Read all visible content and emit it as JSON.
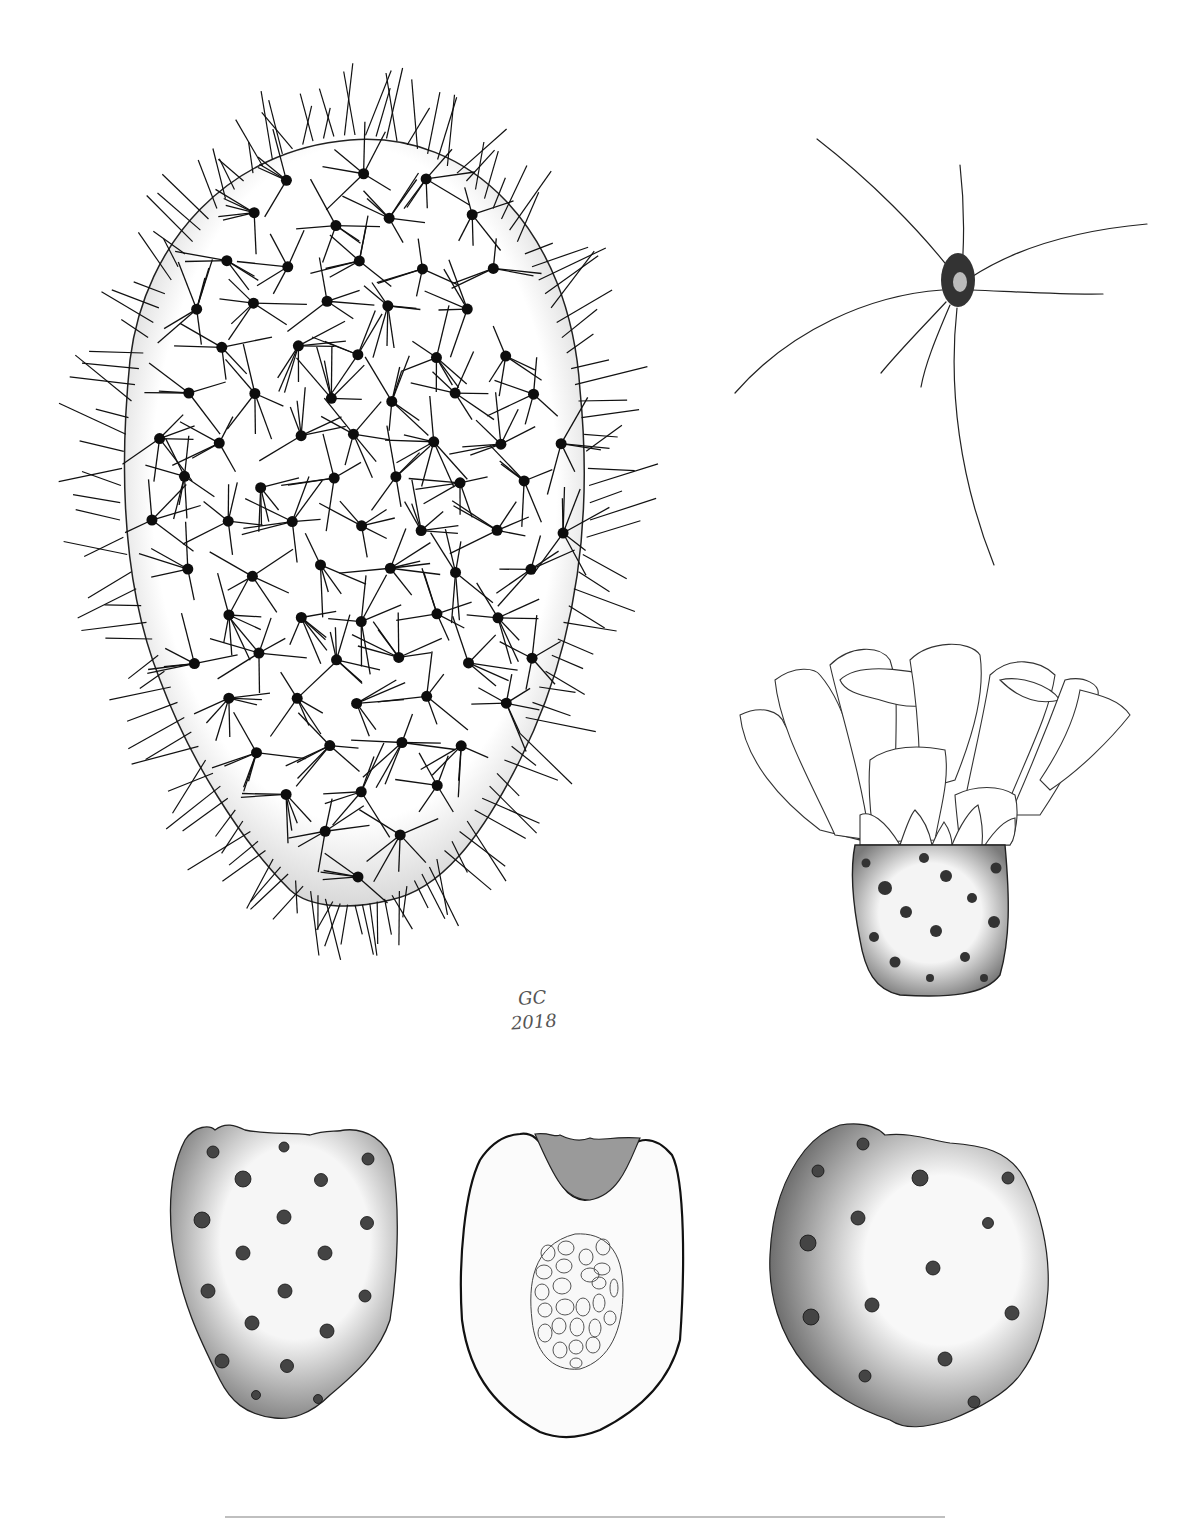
{
  "plate": {
    "background": "#ffffff",
    "ink": "#111111",
    "stipple": "#333333"
  },
  "signature": {
    "initials": "GC",
    "year": "2018"
  },
  "figures": [
    {
      "id": "cladode",
      "label": "Cladode (pad) with spine clusters"
    },
    {
      "id": "areole",
      "label": "Single areole with spines"
    },
    {
      "id": "flower",
      "label": "Flower with ovary"
    },
    {
      "id": "fruit-side",
      "label": "Fruit, lateral view"
    },
    {
      "id": "fruit-section",
      "label": "Fruit, longitudinal section with seeds"
    },
    {
      "id": "fruit-front",
      "label": "Fruit, frontal view"
    }
  ],
  "scale_bar": {
    "visible": true
  }
}
